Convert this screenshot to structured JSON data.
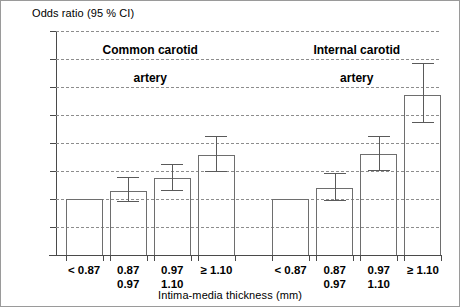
{
  "chart_data": {
    "type": "bar",
    "title": "Odds ratio (95 % CI)",
    "xlabel": "Intima-media thickness (mm)",
    "ylabel": "Odds ratio (95 % CI)",
    "ylim": [
      0,
      4
    ],
    "grid": true,
    "legend": "none",
    "ytick_labels": [
      "0",
      "0,5",
      "1",
      "1,5",
      "2",
      "2,5",
      "3",
      "3,5",
      "4"
    ],
    "ytick_values": [
      0,
      0.5,
      1,
      1.5,
      2,
      2.5,
      3,
      3.5,
      4
    ],
    "groups": [
      {
        "name": "Common carotid artery",
        "title_line1": "Common carotid",
        "title_line2": "artery",
        "categories": [
          "< 0.87",
          "0.87\n0.97",
          "0.97\n1.10",
          "≥ 1.10"
        ],
        "category_labels": [
          {
            "line1": "< 0.87",
            "line2": ""
          },
          {
            "line1": "0.87",
            "line2": "0.97"
          },
          {
            "line1": "0.97",
            "line2": "1.10"
          },
          {
            "line1": "≥ 1.10",
            "line2": ""
          }
        ],
        "values": [
          1.0,
          1.15,
          1.38,
          1.78
        ],
        "ci_low": [
          null,
          0.94,
          1.15,
          1.48
        ],
        "ci_high": [
          null,
          1.4,
          1.63,
          2.13
        ]
      },
      {
        "name": "Internal carotid artery",
        "title_line1": "Internal carotid",
        "title_line2": "artery",
        "categories": [
          "< 0.87",
          "0.87\n0.97",
          "0.97\n1.10",
          "≥ 1.10"
        ],
        "category_labels": [
          {
            "line1": "< 0.87",
            "line2": ""
          },
          {
            "line1": "0.87",
            "line2": "0.97"
          },
          {
            "line1": "0.97",
            "line2": "1.10"
          },
          {
            "line1": "≥ 1.10",
            "line2": ""
          }
        ],
        "values": [
          1.0,
          1.2,
          1.8,
          2.85
        ],
        "ci_low": [
          null,
          0.97,
          1.5,
          2.35
        ],
        "ci_high": [
          null,
          1.47,
          2.13,
          3.42
        ]
      }
    ],
    "colors": {
      "bar_stroke": "#6e6e6e",
      "grid": "#8d8d8d",
      "axis": "#4a4a4a",
      "text": "#000000",
      "background": "#ffffff"
    }
  }
}
